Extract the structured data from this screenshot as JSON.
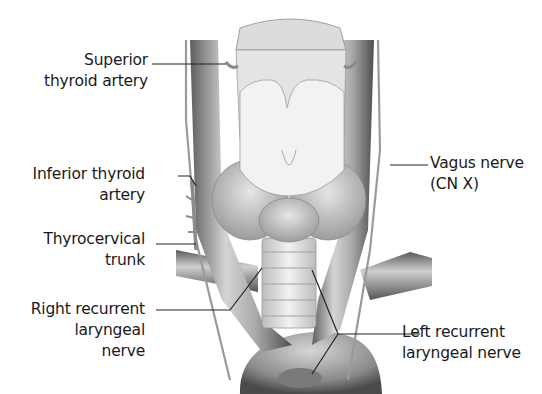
{
  "figure": {
    "colors": {
      "background": "#ffffff",
      "text": "#1a1a1a",
      "leader_line": "#222222",
      "vessel_dark": "#6a6a6a",
      "vessel_light": "#d8d8d8",
      "gland": "#c8c8c8"
    }
  },
  "labels": {
    "superior_thyroid_artery": {
      "line1": "Superior",
      "line2": "thyroid artery"
    },
    "inferior_thyroid_artery": {
      "line1": "Inferior thyroid",
      "line2": "artery"
    },
    "thyrocervical_trunk": {
      "line1": "Thyrocervical",
      "line2": "trunk"
    },
    "right_recurrent_laryngeal_nerve": {
      "line1": "Right recurrent",
      "line2": "laryngeal",
      "line3": "nerve"
    },
    "vagus_nerve": {
      "line1": "Vagus nerve",
      "line2": "(CN X)"
    },
    "left_recurrent_laryngeal_nerve": {
      "line1": "Left recurrent",
      "line2": "laryngeal nerve"
    }
  }
}
